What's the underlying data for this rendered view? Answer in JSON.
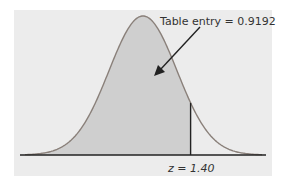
{
  "chart_data": {
    "type": "area",
    "title": "",
    "distribution": {
      "mean": 0,
      "sd": 1
    },
    "shaded_region": {
      "from": "-inf",
      "to": 1.4
    },
    "annotations": [
      {
        "text": "Table entry = 0.9192",
        "points_to": "shaded area"
      },
      {
        "text": "z = 1.40",
        "position": "below axis at z = 1.40"
      }
    ],
    "xlabel": "",
    "ylabel": "",
    "grid": false,
    "legend": null
  },
  "labels": {
    "table_entry": "Table entry = 0.9192",
    "z_value": "z = 1.40"
  },
  "colors": {
    "panel": "#ececec",
    "shade": "#cfcfcf",
    "curve": "#8a807a",
    "axis": "#222222"
  }
}
